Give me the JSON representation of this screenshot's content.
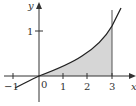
{
  "figure": {
    "type": "function-plot",
    "axes": {
      "x_label": "x",
      "y_label": "y",
      "x_ticks": [
        "−1",
        "0",
        "1",
        "2",
        "3"
      ],
      "y_ticks": [
        "1"
      ]
    },
    "shaded_region": {
      "from": 0,
      "to": 3,
      "fill": "#d6d6d6"
    },
    "curve_color": "#222222",
    "axis_color": "#333333"
  }
}
